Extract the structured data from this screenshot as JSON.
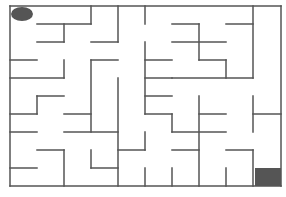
{
  "maze": {
    "grid": {
      "cols": 10,
      "rows": 10,
      "left": 10,
      "top": 6,
      "right": 281,
      "bottom": 186
    },
    "colors": {
      "wall": "#555555",
      "player": "#555555",
      "goal": "#555555",
      "background": "#ffffff"
    },
    "player": {
      "shape": "ellipse",
      "cx": 22,
      "cy": 14,
      "rx": 11,
      "ry": 7
    },
    "goal": {
      "x": 255,
      "y": 168,
      "w": 26,
      "h": 18
    },
    "walls": [
      [
        10,
        6,
        281,
        6
      ],
      [
        10,
        6,
        10,
        186
      ],
      [
        281,
        6,
        281,
        186
      ],
      [
        10,
        186,
        281,
        186
      ],
      [
        91,
        6,
        91,
        24
      ],
      [
        37,
        24,
        91,
        24
      ],
      [
        64,
        24,
        64,
        42
      ],
      [
        37,
        42,
        64,
        42
      ],
      [
        118,
        6,
        118,
        42
      ],
      [
        91,
        42,
        118,
        42
      ],
      [
        145,
        6,
        145,
        24
      ],
      [
        172,
        24,
        199,
        24
      ],
      [
        199,
        24,
        199,
        60
      ],
      [
        172,
        42,
        226,
        42
      ],
      [
        226,
        24,
        253,
        24
      ],
      [
        253,
        6,
        253,
        78
      ],
      [
        10,
        60,
        37,
        60
      ],
      [
        64,
        60,
        64,
        78
      ],
      [
        10,
        78,
        64,
        78
      ],
      [
        91,
        60,
        118,
        60
      ],
      [
        91,
        60,
        91,
        132
      ],
      [
        118,
        78,
        118,
        186
      ],
      [
        145,
        42,
        145,
        114
      ],
      [
        145,
        60,
        172,
        60
      ],
      [
        145,
        78,
        172,
        78
      ],
      [
        145,
        96,
        172,
        96
      ],
      [
        145,
        114,
        172,
        114
      ],
      [
        172,
        114,
        172,
        132
      ],
      [
        199,
        60,
        226,
        60
      ],
      [
        226,
        60,
        226,
        78
      ],
      [
        172,
        78,
        253,
        78
      ],
      [
        37,
        96,
        64,
        96
      ],
      [
        37,
        96,
        37,
        114
      ],
      [
        10,
        114,
        37,
        114
      ],
      [
        64,
        114,
        91,
        114
      ],
      [
        199,
        96,
        199,
        186
      ],
      [
        199,
        114,
        226,
        114
      ],
      [
        253,
        96,
        253,
        132
      ],
      [
        253,
        114,
        281,
        114
      ],
      [
        10,
        132,
        37,
        132
      ],
      [
        64,
        132,
        118,
        132
      ],
      [
        172,
        132,
        226,
        132
      ],
      [
        37,
        150,
        64,
        150
      ],
      [
        64,
        150,
        64,
        186
      ],
      [
        10,
        168,
        37,
        168
      ],
      [
        91,
        150,
        91,
        168
      ],
      [
        91,
        168,
        118,
        168
      ],
      [
        118,
        150,
        145,
        150
      ],
      [
        145,
        132,
        145,
        150
      ],
      [
        172,
        150,
        199,
        150
      ],
      [
        226,
        150,
        253,
        150
      ],
      [
        253,
        150,
        253,
        186
      ],
      [
        145,
        168,
        145,
        186
      ],
      [
        172,
        168,
        172,
        186
      ],
      [
        226,
        168,
        226,
        186
      ]
    ]
  }
}
